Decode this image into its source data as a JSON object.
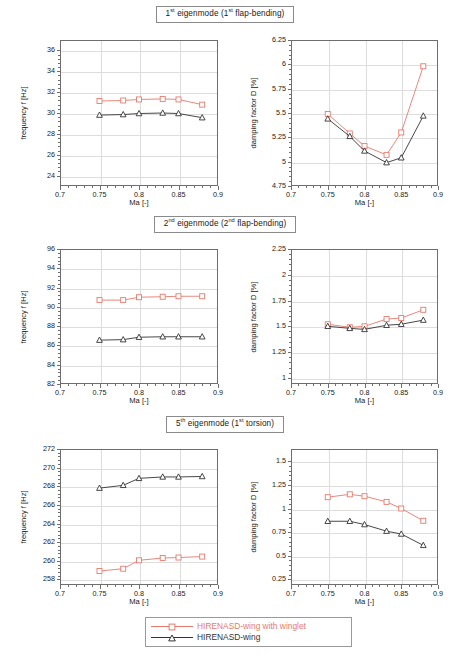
{
  "figure": {
    "axis_x_title": "Ma [-]",
    "axis_y_title_frequency": "frequency f [Hz]",
    "axis_y_title_damping": "damping factor D [%]",
    "colors": {
      "series_winglet": "#e8796c",
      "series_wing": "#333333",
      "frame": "#6e6e6e",
      "grid": "#dddddd"
    }
  },
  "rows": [
    {
      "title_html": "1<sup>st</sup> eigenmode (1<sup>st</sup> flap-bending)"
    },
    {
      "title_html": "2<sup>nd</sup> eigenmode (2<sup>nd</sup> flap-bending)"
    },
    {
      "title_html": "5<sup>th</sup> eigenmode (1<sup>st</sup> torsion)"
    }
  ],
  "legend": {
    "entries": [
      {
        "label": "HIRENASD-wing with winglet",
        "color": "#e8796c",
        "marker": "square"
      },
      {
        "label": "HIRENASD-wing",
        "color": "#333333",
        "marker": "triangle"
      }
    ]
  },
  "chart_data": [
    {
      "id": "mode1-frequency",
      "type": "line",
      "title": "1st eigenmode (1st flap-bending)",
      "xlabel": "Ma [-]",
      "ylabel": "frequency f [Hz]",
      "xlim": [
        0.7,
        0.9
      ],
      "ylim": [
        23,
        37
      ],
      "xticks": [
        0.7,
        0.75,
        0.8,
        0.85,
        0.9
      ],
      "xticklabels": [
        "0.7",
        "0.75",
        "0.8",
        "0.85",
        "0.9"
      ],
      "yticks": [
        24,
        26,
        28,
        30,
        32,
        34,
        36
      ],
      "yticklabels": [
        "24",
        "26",
        "28",
        "30",
        "32",
        "34",
        "36"
      ],
      "grid": true,
      "x": [
        0.75,
        0.78,
        0.8,
        0.83,
        0.85,
        0.88
      ],
      "series": [
        {
          "name": "HIRENASD-wing with winglet",
          "marker": "square",
          "color": "#e8796c",
          "values": [
            31.15,
            31.2,
            31.3,
            31.35,
            31.3,
            30.8
          ]
        },
        {
          "name": "HIRENASD-wing",
          "marker": "triangle",
          "color": "#333333",
          "values": [
            29.8,
            29.85,
            29.95,
            30.0,
            29.95,
            29.55
          ]
        }
      ]
    },
    {
      "id": "mode1-damping",
      "type": "line",
      "title": "1st eigenmode (1st flap-bending)",
      "xlabel": "Ma [-]",
      "ylabel": "damping factor D [%]",
      "xlim": [
        0.7,
        0.9
      ],
      "ylim": [
        4.75,
        6.25
      ],
      "xticks": [
        0.7,
        0.75,
        0.8,
        0.85,
        0.9
      ],
      "xticklabels": [
        "0.7",
        "0.75",
        "0.8",
        "0.85",
        "0.9"
      ],
      "yticks": [
        4.75,
        5,
        5.25,
        5.5,
        5.75,
        6,
        6.25
      ],
      "yticklabels": [
        "4.75",
        "5",
        "5.25",
        "5.5",
        "5.75",
        "6",
        "6.25"
      ],
      "grid": true,
      "x": [
        0.75,
        0.78,
        0.8,
        0.83,
        0.85,
        0.88
      ],
      "series": [
        {
          "name": "HIRENASD-wing with winglet",
          "marker": "square",
          "color": "#e8796c",
          "values": [
            5.49,
            5.29,
            5.16,
            5.07,
            5.3,
            5.98
          ]
        },
        {
          "name": "HIRENASD-wing",
          "marker": "triangle",
          "color": "#333333",
          "values": [
            5.44,
            5.26,
            5.11,
            4.99,
            5.04,
            5.47
          ]
        }
      ]
    },
    {
      "id": "mode2-frequency",
      "type": "line",
      "title": "2nd eigenmode (2nd flap-bending)",
      "xlabel": "Ma [-]",
      "ylabel": "frequency f [Hz]",
      "xlim": [
        0.7,
        0.9
      ],
      "ylim": [
        82,
        96
      ],
      "xticks": [
        0.7,
        0.75,
        0.8,
        0.85,
        0.9
      ],
      "xticklabels": [
        "0.7",
        "0.75",
        "0.8",
        "0.85",
        "0.9"
      ],
      "yticks": [
        82,
        84,
        86,
        88,
        90,
        92,
        94,
        96
      ],
      "yticklabels": [
        "82",
        "84",
        "86",
        "88",
        "90",
        "92",
        "94",
        "96"
      ],
      "grid": true,
      "x": [
        0.75,
        0.78,
        0.8,
        0.83,
        0.85,
        0.88
      ],
      "series": [
        {
          "name": "HIRENASD-wing with winglet",
          "marker": "square",
          "color": "#e8796c",
          "values": [
            90.7,
            90.7,
            91.0,
            91.05,
            91.1,
            91.1
          ]
        },
        {
          "name": "HIRENASD-wing",
          "marker": "triangle",
          "color": "#333333",
          "values": [
            86.55,
            86.6,
            86.85,
            86.9,
            86.9,
            86.9
          ]
        }
      ]
    },
    {
      "id": "mode2-damping",
      "type": "line",
      "title": "2nd eigenmode (2nd flap-bending)",
      "xlabel": "Ma [-]",
      "ylabel": "damping factor D [%]",
      "xlim": [
        0.7,
        0.9
      ],
      "ylim": [
        0.94,
        2.25
      ],
      "xticks": [
        0.7,
        0.75,
        0.8,
        0.85,
        0.9
      ],
      "xticklabels": [
        "0.7",
        "0.75",
        "0.8",
        "0.85",
        "0.9"
      ],
      "yticks": [
        1,
        1.25,
        1.5,
        1.75,
        2,
        2.25
      ],
      "yticklabels": [
        "1",
        "1.25",
        "1.5",
        "1.75",
        "2",
        "2.25"
      ],
      "grid": true,
      "x": [
        0.75,
        0.78,
        0.8,
        0.83,
        0.85,
        0.88
      ],
      "series": [
        {
          "name": "HIRENASD-wing with winglet",
          "marker": "square",
          "color": "#e8796c",
          "values": [
            1.52,
            1.49,
            1.5,
            1.57,
            1.58,
            1.66
          ]
        },
        {
          "name": "HIRENASD-wing",
          "marker": "triangle",
          "color": "#333333",
          "values": [
            1.5,
            1.48,
            1.47,
            1.51,
            1.52,
            1.56
          ]
        }
      ]
    },
    {
      "id": "mode5-frequency",
      "type": "line",
      "title": "5th eigenmode (1st torsion)",
      "xlabel": "Ma [-]",
      "ylabel": "frequency f [Hz]",
      "xlim": [
        0.7,
        0.9
      ],
      "ylim": [
        257.4,
        272
      ],
      "xticks": [
        0.7,
        0.75,
        0.8,
        0.85,
        0.9
      ],
      "xticklabels": [
        "0.7",
        "0.75",
        "0.8",
        "0.85",
        "0.9"
      ],
      "yticks": [
        258,
        260,
        262,
        264,
        266,
        268,
        270,
        272
      ],
      "yticklabels": [
        "258",
        "260",
        "262",
        "264",
        "266",
        "268",
        "270",
        "272"
      ],
      "grid": true,
      "x": [
        0.75,
        0.78,
        0.8,
        0.83,
        0.85,
        0.88
      ],
      "series": [
        {
          "name": "HIRENASD-wing with winglet",
          "marker": "square",
          "color": "#e8796c",
          "values": [
            258.9,
            259.15,
            260.05,
            260.3,
            260.35,
            260.45
          ]
        },
        {
          "name": "HIRENASD-wing",
          "marker": "triangle",
          "color": "#333333",
          "values": [
            267.8,
            268.1,
            268.85,
            269.0,
            269.0,
            269.05
          ]
        }
      ]
    },
    {
      "id": "mode5-damping",
      "type": "line",
      "title": "5th eigenmode (1st torsion)",
      "xlabel": "Ma [-]",
      "ylabel": "damping factor D [%]",
      "xlim": [
        0.7,
        0.9
      ],
      "ylim": [
        0.19,
        1.63
      ],
      "xticks": [
        0.7,
        0.75,
        0.8,
        0.85,
        0.9
      ],
      "xticklabels": [
        "0.7",
        "0.75",
        "0.8",
        "0.85",
        "0.9"
      ],
      "yticks": [
        0.25,
        0.5,
        0.75,
        1,
        1.25,
        1.5
      ],
      "yticklabels": [
        "0.25",
        "0.5",
        "0.75",
        "1",
        "1.25",
        "1.5"
      ],
      "grid": true,
      "x": [
        0.75,
        0.78,
        0.8,
        0.83,
        0.85,
        0.88
      ],
      "series": [
        {
          "name": "HIRENASD-wing with winglet",
          "marker": "square",
          "color": "#e8796c",
          "values": [
            1.12,
            1.15,
            1.13,
            1.07,
            1.0,
            0.87
          ]
        },
        {
          "name": "HIRENASD-wing",
          "marker": "triangle",
          "color": "#333333",
          "values": [
            0.865,
            0.865,
            0.83,
            0.76,
            0.73,
            0.61
          ]
        }
      ]
    }
  ]
}
